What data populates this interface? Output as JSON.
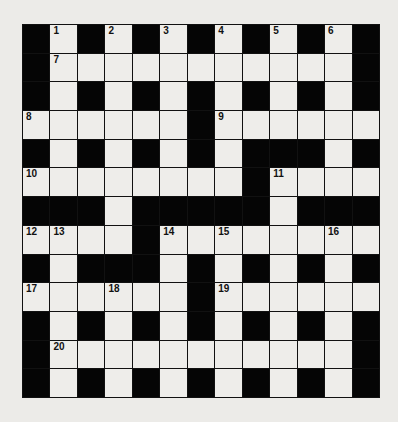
{
  "puzzle": {
    "rows": 13,
    "cols": 13,
    "grid": [
      "#.#.#.#.#.#.#",
      "#...........#",
      "#.#.#.#.#.#.#",
      "......#......",
      "#.#.#.#.###.#",
      "........#....",
      "###.#####.###",
      "....#........",
      "#.###.#.#.#.#",
      "......#......",
      "#.#.#.#.#.#.#",
      "#...........#",
      "#.#.#.#.#.#.#"
    ],
    "numbers": [
      {
        "n": "1",
        "r": 0,
        "c": 1
      },
      {
        "n": "2",
        "r": 0,
        "c": 3
      },
      {
        "n": "3",
        "r": 0,
        "c": 5
      },
      {
        "n": "4",
        "r": 0,
        "c": 7
      },
      {
        "n": "5",
        "r": 0,
        "c": 9
      },
      {
        "n": "6",
        "r": 0,
        "c": 11
      },
      {
        "n": "7",
        "r": 1,
        "c": 1
      },
      {
        "n": "8",
        "r": 3,
        "c": 0
      },
      {
        "n": "9",
        "r": 3,
        "c": 7
      },
      {
        "n": "10",
        "r": 5,
        "c": 0
      },
      {
        "n": "11",
        "r": 5,
        "c": 9
      },
      {
        "n": "12",
        "r": 7,
        "c": 0
      },
      {
        "n": "13",
        "r": 7,
        "c": 1
      },
      {
        "n": "14",
        "r": 7,
        "c": 5
      },
      {
        "n": "15",
        "r": 7,
        "c": 7
      },
      {
        "n": "16",
        "r": 7,
        "c": 11
      },
      {
        "n": "17",
        "r": 9,
        "c": 0
      },
      {
        "n": "18",
        "r": 9,
        "c": 3
      },
      {
        "n": "19",
        "r": 9,
        "c": 7
      },
      {
        "n": "20",
        "r": 11,
        "c": 1
      }
    ],
    "colors": {
      "block": "#050505",
      "empty": "#eeedea",
      "background": "#ecebe8"
    }
  }
}
